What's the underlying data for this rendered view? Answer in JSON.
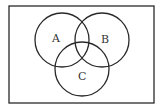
{
  "diagram": {
    "type": "venn",
    "universe": {
      "x": 9,
      "y": 6,
      "width": 145,
      "height": 97
    },
    "sets": [
      {
        "label": "A",
        "cx": 62,
        "cy": 40,
        "r": 27,
        "label_x": 55,
        "label_y": 42
      },
      {
        "label": "B",
        "cx": 102,
        "cy": 40,
        "r": 27,
        "label_x": 104,
        "label_y": 43
      },
      {
        "label": "C",
        "cx": 82,
        "cy": 69,
        "r": 27,
        "label_x": 79,
        "label_y": 80
      }
    ],
    "stroke_color": "#2a2a2a"
  }
}
